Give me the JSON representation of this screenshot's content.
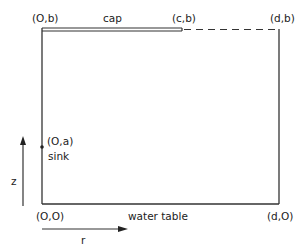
{
  "diagram": {
    "colors": {
      "stroke": "#333333",
      "text": "#222222",
      "background": "#ffffff"
    },
    "corners": {
      "top_left": "(O,b)",
      "cap_end": "(c,b)",
      "top_right": "(d,b)",
      "bottom_left": "(O,O)",
      "bottom_right": "(d,O)",
      "sink_point": "(O,a)"
    },
    "labels": {
      "cap": "cap",
      "sink": "sink",
      "water_table": "water table"
    },
    "axes": {
      "vertical": "z",
      "horizontal": "r"
    }
  }
}
